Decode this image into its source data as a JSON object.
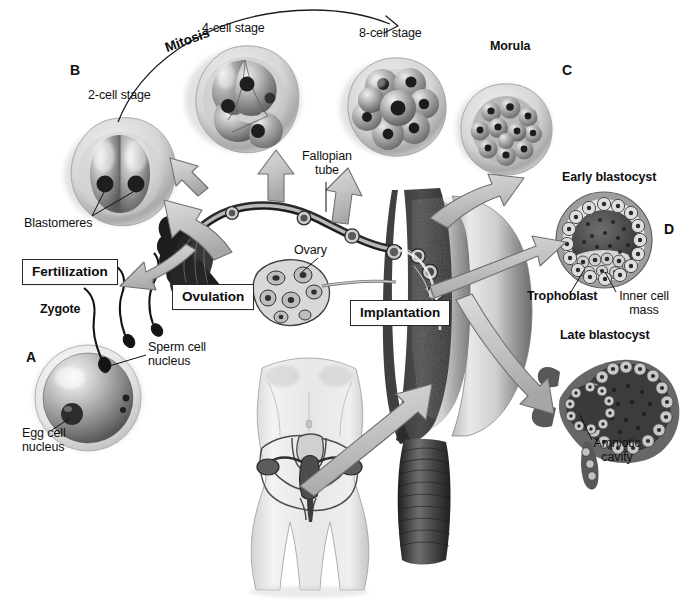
{
  "figure": {
    "background_color": "#ffffff",
    "ink_color": "#101010",
    "arrow_fill": "#c9c9c9",
    "arrow_stroke": "#4a4a4a"
  },
  "panel_letters": [
    {
      "id": "A",
      "label": "A",
      "x": 26,
      "y": 357
    },
    {
      "id": "B",
      "label": "B",
      "x": 70,
      "y": 65
    },
    {
      "id": "C",
      "label": "C",
      "x": 562,
      "y": 64
    },
    {
      "id": "D",
      "label": "D",
      "x": 664,
      "y": 222
    }
  ],
  "process_boxes": [
    {
      "id": "fertilization",
      "label": "Fertilization",
      "x": 22,
      "y": 259,
      "width": 106
    },
    {
      "id": "ovulation",
      "label": "Ovulation",
      "x": 172,
      "y": 284,
      "width": 92
    },
    {
      "id": "implantation",
      "label": "Implantation",
      "x": 350,
      "y": 300,
      "width": 105
    }
  ],
  "mitosis": {
    "label": "Mitosis",
    "x": 168,
    "y": 33,
    "rotation_deg": -17
  },
  "stage_labels": [
    {
      "id": "two-cell",
      "label": "2-cell stage",
      "x": 88,
      "y": 95,
      "bold": false,
      "align": "left"
    },
    {
      "id": "four-cell",
      "label": "4-cell stage",
      "x": 202,
      "y": 28,
      "bold": false,
      "align": "left"
    },
    {
      "id": "eight-cell",
      "label": "8-cell stage",
      "x": 359,
      "y": 33,
      "bold": false,
      "align": "left"
    },
    {
      "id": "morula",
      "label": "Morula",
      "x": 490,
      "y": 46,
      "bold": true,
      "align": "left"
    },
    {
      "id": "early-blastocyst",
      "label": "Early blastocyst",
      "x": 562,
      "y": 177,
      "bold": true,
      "align": "left"
    },
    {
      "id": "late-blastocyst",
      "label": "Late blastocyst",
      "x": 560,
      "y": 335,
      "bold": true,
      "align": "left"
    },
    {
      "id": "zygote",
      "label": "Zygote",
      "x": 40,
      "y": 309,
      "bold": true,
      "align": "left"
    }
  ],
  "leader_labels": [
    {
      "id": "blastomeres",
      "label": "Blastomeres",
      "x": 24,
      "y": 222,
      "bold": false
    },
    {
      "id": "fallopian-tube",
      "label": "Fallopian\ntube",
      "x": 303,
      "y": 157,
      "bold": false
    },
    {
      "id": "ovary",
      "label": "Ovary",
      "x": 294,
      "y": 250,
      "bold": false
    },
    {
      "id": "sperm-nucleus",
      "label": "Sperm cell\nnucleus",
      "x": 148,
      "y": 347,
      "bold": false
    },
    {
      "id": "egg-nucleus",
      "label": "Egg cell\nnucleus",
      "x": 22,
      "y": 433,
      "bold": false
    },
    {
      "id": "trophoblast",
      "label": "Trophoblast",
      "x": 527,
      "y": 295,
      "bold": true
    },
    {
      "id": "inner-cell-mass",
      "label": "Inner cell\nmass",
      "x": 613,
      "y": 295,
      "bold": false
    },
    {
      "id": "amniotic-cavity",
      "label": "Amniotic\ncavity",
      "x": 588,
      "y": 443,
      "bold": false
    }
  ],
  "structures": {
    "zygote": "single fertilized egg cell with zona pellucida, egg cell nucleus and sperm cell nucleus",
    "two_cell": "embryo with two blastomeres inside zona pellucida",
    "four_cell": "embryo with four blastomeres",
    "eight_cell": "embryo with eight blastomeres",
    "morula": "solid ball of many cells",
    "early_blastocyst": "hollow sphere with trophoblast ring and inner cell mass",
    "late_blastocyst": "implanting blastocyst with amniotic cavity",
    "reproductive_tract": "uterus, endometrium, fallopian tube, ovary and cervix in cross-section",
    "female_figure": "female torso showing pelvis and reproductive organs",
    "sperm": "three sperm cells approaching the zygote"
  }
}
